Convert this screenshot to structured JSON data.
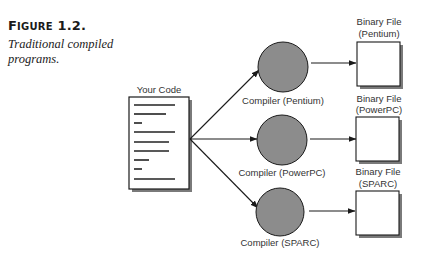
{
  "caption": {
    "figure_label_prefix": "F",
    "figure_label_rest": "IGURE",
    "figure_number": "1.2.",
    "description": "Traditional compiled programs."
  },
  "diagram": {
    "source": {
      "label": "Your Code",
      "line_widths": [
        41,
        32,
        8,
        41,
        35,
        35,
        15,
        8,
        41
      ]
    },
    "compilers": [
      {
        "label": "Compiler (Pentium)"
      },
      {
        "label": "Compiler (PowerPC)"
      },
      {
        "label": "Compiler (SPARC)"
      }
    ],
    "outputs": [
      {
        "label_line1": "Binary File",
        "label_line2": "(Pentium)"
      },
      {
        "label_line1": "Binary File",
        "label_line2": "(PowerPC)"
      },
      {
        "label_line1": "Binary File",
        "label_line2": "(SPARC)"
      }
    ],
    "colors": {
      "compiler_fill": "#8c8c8c",
      "stroke": "#1a1a1a",
      "shadow": "#7a7a7a"
    }
  }
}
